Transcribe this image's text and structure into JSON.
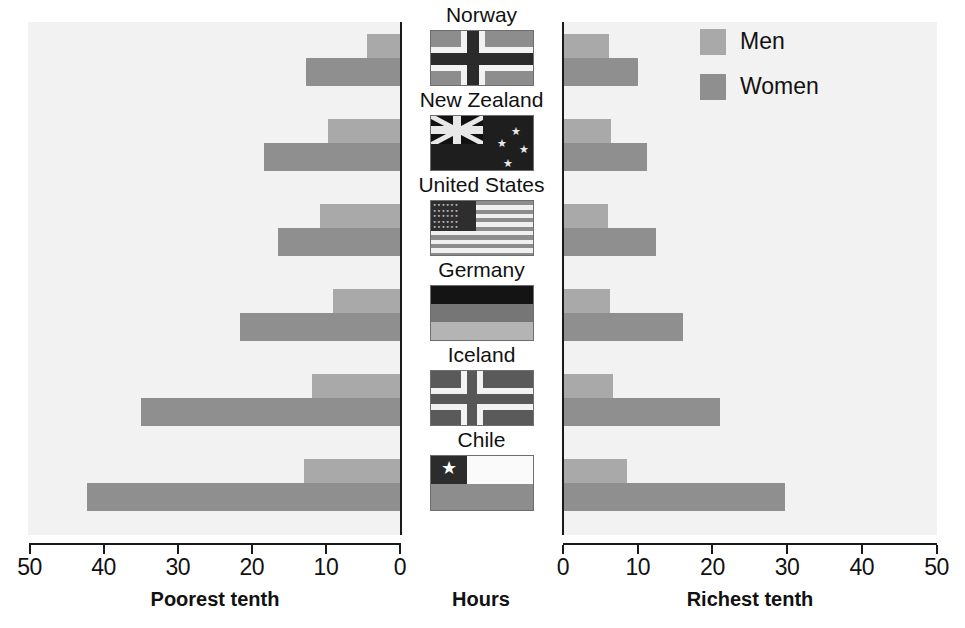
{
  "chart_data": {
    "type": "bar",
    "title": "",
    "orientation": "horizontal-bidirectional",
    "xlabel_center": "Hours",
    "left_panel": {
      "label": "Poorest tenth",
      "axis_ticks": [
        50,
        40,
        30,
        20,
        10,
        0
      ],
      "xlim": [
        50,
        0
      ],
      "direction": "right-to-left"
    },
    "right_panel": {
      "label": "Richest tenth",
      "axis_ticks": [
        0,
        10,
        20,
        30,
        40,
        50
      ],
      "xlim": [
        0,
        50
      ],
      "direction": "left-to-right"
    },
    "categories": [
      "Norway",
      "New Zealand",
      "United States",
      "Germany",
      "Iceland",
      "Chile"
    ],
    "series": [
      {
        "name": "Men",
        "color": "#a9a9a9",
        "poorest_tenth": [
          4.5,
          9.7,
          10.8,
          9.1,
          11.9,
          13.0
        ],
        "richest_tenth": [
          6.2,
          6.4,
          6.0,
          6.3,
          6.7,
          8.6
        ]
      },
      {
        "name": "Women",
        "color": "#8f8f8f",
        "poorest_tenth": [
          12.7,
          18.4,
          16.4,
          21.6,
          34.9,
          42.2
        ],
        "richest_tenth": [
          10.0,
          11.2,
          12.5,
          16.0,
          21.0,
          29.7
        ]
      }
    ],
    "grid": false,
    "legend_position": "top-right",
    "background_color": "#f2f2f2"
  },
  "axes": {
    "left": {
      "title": "Poorest tenth",
      "ticks": [
        {
          "value": 50,
          "label": "50"
        },
        {
          "value": 40,
          "label": "40"
        },
        {
          "value": 30,
          "label": "30"
        },
        {
          "value": 20,
          "label": "20"
        },
        {
          "value": 10,
          "label": "10"
        },
        {
          "value": 0,
          "label": "0"
        }
      ]
    },
    "center": {
      "title": "Hours"
    },
    "right": {
      "title": "Richest tenth",
      "ticks": [
        {
          "value": 0,
          "label": "0"
        },
        {
          "value": 10,
          "label": "10"
        },
        {
          "value": 20,
          "label": "20"
        },
        {
          "value": 30,
          "label": "30"
        },
        {
          "value": 40,
          "label": "40"
        },
        {
          "value": 50,
          "label": "50"
        }
      ]
    }
  },
  "legend": {
    "items": [
      {
        "label": "Men",
        "color": "#a9a9a9"
      },
      {
        "label": "Women",
        "color": "#8f8f8f"
      }
    ]
  },
  "countries": [
    {
      "name": "Norway",
      "flag": "flag-norway"
    },
    {
      "name": "New Zealand",
      "flag": "flag-nz"
    },
    {
      "name": "United States",
      "flag": "flag-us"
    },
    {
      "name": "Germany",
      "flag": "flag-de"
    },
    {
      "name": "Iceland",
      "flag": "flag-is"
    },
    {
      "name": "Chile",
      "flag": "flag-cl"
    }
  ]
}
